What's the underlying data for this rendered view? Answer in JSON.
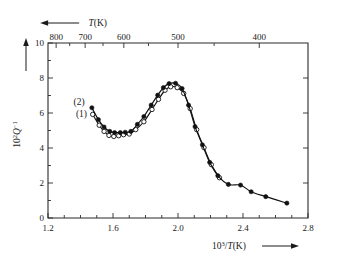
{
  "chart_data": {
    "type": "line",
    "title": "",
    "xlabel": "10³/T(K)",
    "ylabel": "10²Q⁻¹",
    "top_axis_label": "T(K)",
    "xlim": [
      1.2,
      2.8
    ],
    "ylim": [
      0,
      10
    ],
    "xticks": [
      1.2,
      1.6,
      2.0,
      2.4,
      2.8
    ],
    "xtick_labels": [
      "1.2",
      "1.6",
      "2.0",
      "2.4",
      "2.8"
    ],
    "yticks": [
      0,
      2,
      4,
      6,
      8,
      10
    ],
    "ytick_labels": [
      "0",
      "2",
      "4",
      "6",
      "8",
      "10"
    ],
    "x_minor_ticks": [
      1.3,
      1.4,
      1.5,
      1.7,
      1.8,
      1.9,
      2.1,
      2.2,
      2.3,
      2.5,
      2.6,
      2.7
    ],
    "y_minor_ticks": [
      1,
      3,
      5,
      7,
      9
    ],
    "top_axis_ticks": [
      800,
      700,
      600,
      500,
      400
    ],
    "top_axis_tick_labels": [
      "800",
      "700",
      "600",
      "500",
      "400"
    ],
    "top_axis_minor_ticks": [
      750,
      650,
      550,
      450,
      350
    ],
    "grid": false,
    "legend_position": "inside-left",
    "x_arrow_direction": "right",
    "y_arrow_direction": "up",
    "top_arrow_direction": "left",
    "series": [
      {
        "name": "(1)",
        "marker": "open-circle",
        "label_x": 1.44,
        "label_y": 5.95,
        "points": [
          {
            "x": 1.475,
            "y": 5.92
          },
          {
            "x": 1.515,
            "y": 5.3
          },
          {
            "x": 1.545,
            "y": 4.95
          },
          {
            "x": 1.575,
            "y": 4.72
          },
          {
            "x": 1.605,
            "y": 4.66
          },
          {
            "x": 1.635,
            "y": 4.7
          },
          {
            "x": 1.665,
            "y": 4.76
          },
          {
            "x": 1.7,
            "y": 4.8
          },
          {
            "x": 1.74,
            "y": 5.05
          },
          {
            "x": 1.79,
            "y": 5.5
          },
          {
            "x": 1.84,
            "y": 6.2
          },
          {
            "x": 1.88,
            "y": 6.78
          },
          {
            "x": 1.92,
            "y": 7.3
          },
          {
            "x": 1.955,
            "y": 7.5
          },
          {
            "x": 1.995,
            "y": 7.45
          },
          {
            "x": 2.035,
            "y": 7.12
          },
          {
            "x": 2.075,
            "y": 6.25
          },
          {
            "x": 2.115,
            "y": 5.05
          },
          {
            "x": 2.16,
            "y": 4.02
          },
          {
            "x": 2.205,
            "y": 3.05
          },
          {
            "x": 2.255,
            "y": 2.3
          }
        ]
      },
      {
        "name": "(2)",
        "marker": "filled-circle",
        "label_x": 1.425,
        "label_y": 6.65,
        "points": [
          {
            "x": 1.47,
            "y": 6.3
          },
          {
            "x": 1.51,
            "y": 5.62
          },
          {
            "x": 1.545,
            "y": 5.2
          },
          {
            "x": 1.58,
            "y": 4.95
          },
          {
            "x": 1.61,
            "y": 4.88
          },
          {
            "x": 1.645,
            "y": 4.88
          },
          {
            "x": 1.675,
            "y": 4.9
          },
          {
            "x": 1.71,
            "y": 4.95
          },
          {
            "x": 1.75,
            "y": 5.35
          },
          {
            "x": 1.79,
            "y": 5.8
          },
          {
            "x": 1.835,
            "y": 6.45
          },
          {
            "x": 1.875,
            "y": 7.02
          },
          {
            "x": 1.91,
            "y": 7.45
          },
          {
            "x": 1.945,
            "y": 7.68
          },
          {
            "x": 1.985,
            "y": 7.7
          },
          {
            "x": 2.025,
            "y": 7.4
          },
          {
            "x": 2.065,
            "y": 6.45
          },
          {
            "x": 2.105,
            "y": 5.22
          },
          {
            "x": 2.15,
            "y": 4.18
          },
          {
            "x": 2.195,
            "y": 3.18
          },
          {
            "x": 2.245,
            "y": 2.42
          },
          {
            "x": 2.31,
            "y": 1.92
          },
          {
            "x": 2.385,
            "y": 1.88
          },
          {
            "x": 2.45,
            "y": 1.5
          },
          {
            "x": 2.54,
            "y": 1.22
          },
          {
            "x": 2.67,
            "y": 0.85
          }
        ]
      }
    ]
  }
}
